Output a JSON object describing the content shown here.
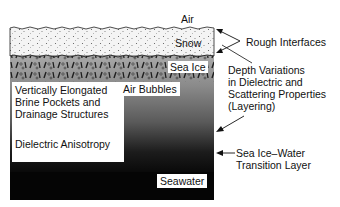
{
  "diagram": {
    "layers": [
      {
        "name": "Air",
        "label": "Air"
      },
      {
        "name": "Snow",
        "label": "Snow"
      },
      {
        "name": "Sea Ice",
        "label": "Sea Ice"
      },
      {
        "name": "Seawater",
        "label": "Seawater"
      }
    ],
    "inner_labels": {
      "brine_line1": "Vertically Elongated",
      "brine_line2": "Brine Pockets and",
      "brine_line3": "Drainage Structures",
      "anisotropy": "Dielectric Anisotropy",
      "air_bubbles": "Air Bubbles"
    },
    "annotations": {
      "rough_interfaces": "Rough Interfaces",
      "depth_line1": "Depth Variations",
      "depth_line2": "in Dielectric and",
      "depth_line3": "Scattering Properties",
      "depth_line4": "(Layering)",
      "transition_line1": "Sea Ice–Water",
      "transition_line2": "Transition Layer"
    },
    "colors": {
      "snow": "#f2f2f2",
      "ice_top": "#9a9a9a",
      "ice_bottom": "#2a2a2a",
      "seawater": "#050505",
      "text": "#111111"
    }
  }
}
